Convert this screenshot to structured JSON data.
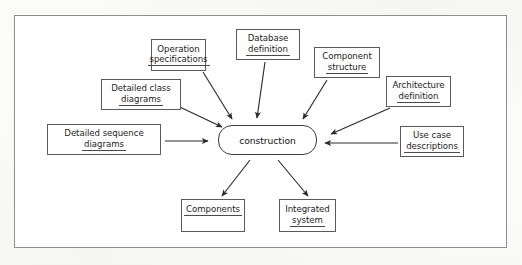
{
  "diagram": {
    "frame_border_color": "#8e8e8e",
    "box_border_color": "#5a5a5a",
    "text_color": "#1c1c1c",
    "background_color": "#ffffff",
    "central_node": {
      "label": "construction",
      "shape": "stadium"
    },
    "inputs": [
      {
        "id": "operation-specifications",
        "line1": "Operation",
        "line2": "specifications"
      },
      {
        "id": "database-definition",
        "line1": "Database",
        "line2": "definition"
      },
      {
        "id": "component-structure",
        "line1": "Component",
        "line2": "structure"
      },
      {
        "id": "architecture-definition",
        "line1": "Architecture",
        "line2": "definition"
      },
      {
        "id": "detailed-class-diagrams",
        "line1": "Detailed class",
        "line2": "diagrams"
      },
      {
        "id": "detailed-sequence-diagrams",
        "line1": "Detailed sequence",
        "line2": "diagrams"
      },
      {
        "id": "use-case-descriptions",
        "line1": "Use case",
        "line2": "descriptions"
      }
    ],
    "outputs": [
      {
        "id": "components",
        "line1": "Components",
        "line2": ""
      },
      {
        "id": "integrated-system",
        "line1": "Integrated",
        "line2": "system"
      }
    ],
    "arrow_count_in": 7,
    "arrow_count_out": 2
  }
}
